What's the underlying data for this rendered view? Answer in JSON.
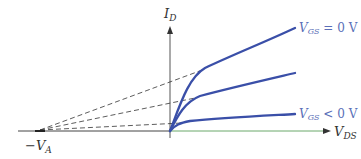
{
  "diagram": {
    "type": "jfet-output-characteristics",
    "y_axis": {
      "label": "I",
      "subscript": "D"
    },
    "x_axis": {
      "label": "V",
      "subscript": "DS"
    },
    "intercept": {
      "label": "−V",
      "subscript": "A"
    },
    "curves": [
      {
        "name": "VGS = 0 V",
        "label_main": "V",
        "label_sub": "GS",
        "label_rest": " = 0 V"
      },
      {
        "name": "middle",
        "label_main": "",
        "label_sub": "",
        "label_rest": ""
      },
      {
        "name": "VGS < 0 V",
        "label_main": "V",
        "label_sub": "GS",
        "label_rest": " < 0 V"
      }
    ],
    "colors": {
      "curve": "#3a4fa8",
      "label": "#5a6fb8",
      "axis": "#444444",
      "axis_x_right": "#6aa86a",
      "dashed": "#333333"
    }
  }
}
